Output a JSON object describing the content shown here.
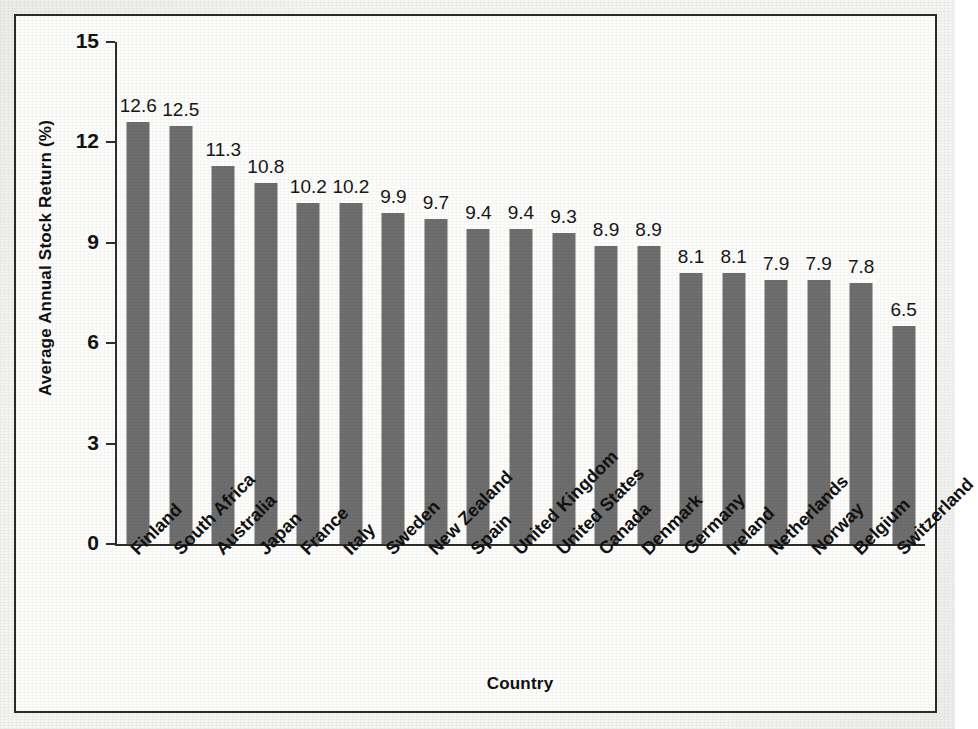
{
  "figure": {
    "background_color": "#f4f4f2",
    "frame_border_color": "#2b2b2b",
    "bar_color": "#6e6e6e"
  },
  "ghost_text": "a moving   Figure 6.1  Average Annual Stock Returns\nof markets   Selected Countries",
  "chart_data": {
    "type": "bar",
    "title": "",
    "xlabel": "Country",
    "ylabel": "Average Annual Stock Return (%)",
    "ylim": [
      0,
      15
    ],
    "yticks": [
      "0",
      "3",
      "6",
      "9",
      "12",
      "15"
    ],
    "ytick_values": [
      0,
      3,
      6,
      9,
      12,
      15
    ],
    "grid": false,
    "legend": "none",
    "label_rotation_deg": -45,
    "categories": [
      "Finland",
      "South Africa",
      "Australia",
      "Japan",
      "France",
      "Italy",
      "Sweden",
      "New Zealand",
      "Spain",
      "United Kingdom",
      "United States",
      "Canada",
      "Denmark",
      "Germany",
      "Ireland",
      "Netherlands",
      "Norway",
      "Belgium",
      "Switzerland"
    ],
    "values": [
      12.6,
      12.5,
      11.3,
      10.8,
      10.2,
      10.2,
      9.9,
      9.7,
      9.4,
      9.4,
      9.3,
      8.9,
      8.9,
      8.1,
      8.1,
      7.9,
      7.9,
      7.8,
      6.5
    ],
    "value_labels": [
      "12.6",
      "12.5",
      "11.3",
      "10.8",
      "10.2",
      "10.2",
      "9.9",
      "9.7",
      "9.4",
      "9.4",
      "9.3",
      "8.9",
      "8.9",
      "8.1",
      "8.1",
      "7.9",
      "7.9",
      "7.8",
      "6.5"
    ]
  }
}
